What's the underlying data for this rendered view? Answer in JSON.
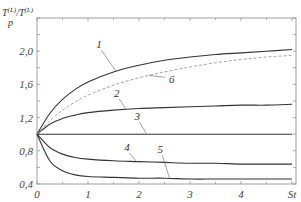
{
  "chart_data": {
    "type": "line",
    "title": "",
    "xlabel": "St",
    "ylabel": "T_p^(L)/T^(L)",
    "ylabel_main": "T",
    "ylabel_sub": "p",
    "ylabel_sup": "(L)",
    "ylabel_den": "/T",
    "ylabel_den_sup": "(L)",
    "xlim": [
      0,
      5
    ],
    "ylim": [
      0.4,
      2.4
    ],
    "grid": false,
    "x_ticks": [
      0,
      1,
      2,
      3,
      4
    ],
    "x_tick_labels": [
      "0",
      "1",
      "2",
      "3",
      "4",
      "St"
    ],
    "y_ticks": [
      0.4,
      0.8,
      1.2,
      1.6,
      2.0
    ],
    "y_tick_labels": [
      "0,4",
      "0,8",
      "1,2",
      "1,6",
      "2,0"
    ],
    "x": [
      0,
      0.25,
      0.5,
      0.75,
      1,
      1.5,
      2,
      2.5,
      3,
      3.5,
      4,
      4.5,
      5
    ],
    "series": [
      {
        "name": "1",
        "style": "solid",
        "values": [
          1.0,
          1.25,
          1.42,
          1.54,
          1.63,
          1.75,
          1.83,
          1.89,
          1.93,
          1.96,
          1.98,
          2.0,
          2.02
        ]
      },
      {
        "name": "2",
        "style": "solid",
        "values": [
          1.0,
          1.12,
          1.19,
          1.23,
          1.26,
          1.29,
          1.31,
          1.32,
          1.33,
          1.34,
          1.35,
          1.35,
          1.36
        ]
      },
      {
        "name": "3",
        "style": "solid",
        "values": [
          1.0,
          1.0,
          1.0,
          1.0,
          1.0,
          1.0,
          1.0,
          1.0,
          1.0,
          1.0,
          1.0,
          1.0,
          1.0
        ]
      },
      {
        "name": "4",
        "style": "solid",
        "values": [
          1.0,
          0.84,
          0.76,
          0.72,
          0.7,
          0.68,
          0.67,
          0.66,
          0.65,
          0.65,
          0.64,
          0.64,
          0.64
        ]
      },
      {
        "name": "5",
        "style": "solid",
        "values": [
          1.0,
          0.68,
          0.56,
          0.51,
          0.49,
          0.48,
          0.47,
          0.47,
          0.46,
          0.46,
          0.46,
          0.46,
          0.46
        ]
      },
      {
        "name": "6",
        "style": "dashed",
        "values": [
          1.0,
          1.16,
          1.29,
          1.39,
          1.47,
          1.59,
          1.68,
          1.75,
          1.81,
          1.86,
          1.9,
          1.93,
          1.95
        ]
      }
    ],
    "annotations": [
      {
        "text": "1",
        "x": 1.2,
        "y": 2.04
      },
      {
        "text": "2",
        "x": 1.55,
        "y": 1.45
      },
      {
        "text": "3",
        "x": 1.95,
        "y": 1.17
      },
      {
        "text": "4",
        "x": 1.75,
        "y": 0.8
      },
      {
        "text": "5",
        "x": 2.4,
        "y": 0.77
      },
      {
        "text": "6",
        "x": 2.55,
        "y": 1.71
      }
    ]
  }
}
